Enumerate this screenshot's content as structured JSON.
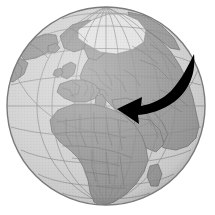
{
  "figure": {
    "type": "orthographic-globe-illustration",
    "title": "World globe centered on Europe and Africa with direction arrow",
    "background_color": "#ffffff",
    "width": 215,
    "height": 215
  },
  "globe": {
    "name": "earth-globe",
    "projection": "orthographic",
    "center_x": 106,
    "center_y": 106,
    "radius": 99,
    "ocean_color": "#d2d2d2",
    "land_color": "#9a9a9a",
    "ice_color": "#e2e2e2",
    "border_color": "#6e6e6e",
    "graticule_color": "#8d8d8d",
    "outline_color": "#7a7a7a",
    "shade_color": "#6f6f6f",
    "graticule_spacing_degrees": 15,
    "center_longitude": 15,
    "center_latitude": 30
  },
  "arrow": {
    "name": "direction-arrow",
    "color": "#000000",
    "description": "Curved swoosh arrow sweeping from the North Atlantic / Scandinavia region down and to the left, pointing at central Europe",
    "tail_x": 193,
    "tail_y": 55,
    "tip_x": 117,
    "tip_y": 109,
    "direction": "northeast-to-southwest"
  },
  "regions": [
    {
      "name": "arctic-ice-cap",
      "label": "Arctic"
    },
    {
      "name": "europe",
      "label": "Europe"
    },
    {
      "name": "africa",
      "label": "Africa"
    },
    {
      "name": "asia-west",
      "label": "Western Asia"
    },
    {
      "name": "greenland",
      "label": "Greenland"
    },
    {
      "name": "atlantic-ocean",
      "label": "Atlantic Ocean"
    },
    {
      "name": "mediterranean-sea",
      "label": "Mediterranean Sea"
    }
  ],
  "caption": {
    "text": ""
  }
}
